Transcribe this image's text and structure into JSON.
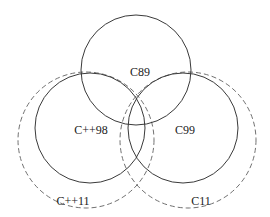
{
  "diagram": {
    "type": "venn",
    "sets": [
      {
        "id": "c89",
        "label": "C89",
        "style": "solid",
        "cx": 136,
        "cy": 70,
        "r": 55,
        "label_x": 140,
        "label_y": 72
      },
      {
        "id": "cpp98",
        "label": "C++98",
        "style": "solid",
        "cx": 90,
        "cy": 128,
        "r": 55,
        "label_x": 91,
        "label_y": 130
      },
      {
        "id": "c99",
        "label": "C99",
        "style": "solid",
        "cx": 183,
        "cy": 128,
        "r": 55,
        "label_x": 185,
        "label_y": 130
      },
      {
        "id": "cpp11",
        "label": "C++11",
        "style": "dashed",
        "cx": 86,
        "cy": 140,
        "r": 68,
        "label_x": 73,
        "label_y": 201
      },
      {
        "id": "c11",
        "label": "C11",
        "style": "dashed",
        "cx": 188,
        "cy": 140,
        "r": 68,
        "label_x": 201,
        "label_y": 201
      }
    ]
  }
}
